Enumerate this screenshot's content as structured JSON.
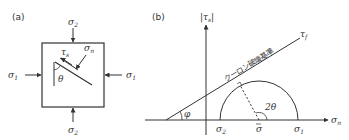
{
  "panel_a": {
    "label": "(a)",
    "sigma1": "σ",
    "sigma1_sub": "1",
    "sigma2": "σ",
    "sigma2_sub": "2",
    "tau_s": "τ",
    "tau_s_sub": "s",
    "sigma_n": "σ",
    "sigma_n_sub": "n",
    "theta": "θ"
  },
  "panel_b": {
    "label": "(b)",
    "y_axis": "|τ",
    "y_axis_sub": "s",
    "y_axis_close": "|",
    "x_axis": "σ",
    "x_axis_sub": "n",
    "tau_f": "τ",
    "tau_f_sub": "f",
    "criterion_label": "クーロン破壊基準",
    "phi": "φ",
    "two_theta": "2θ",
    "sigma2": "σ",
    "sigma2_sub": "2",
    "sigma_bar": "σ",
    "sigma1": "σ",
    "sigma1_sub": "1"
  },
  "colors": {
    "line": "#333333",
    "background": "#ffffff"
  }
}
